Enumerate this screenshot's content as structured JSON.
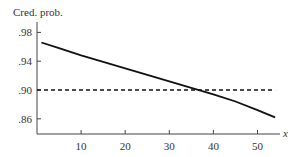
{
  "chart_data": {
    "type": "line",
    "title": "",
    "ylabel": "Cred. prob.",
    "xlabel": "x",
    "xlim": [
      0,
      55
    ],
    "ylim": [
      0.853,
      0.988
    ],
    "grid": false,
    "legend": null,
    "x_ticks": [
      10,
      20,
      30,
      40,
      50
    ],
    "x_tick_labels": [
      "10",
      "20",
      "30",
      "40",
      "50"
    ],
    "y_ticks": [
      0.98,
      0.94,
      0.9,
      0.86
    ],
    "y_tick_labels": [
      ".98",
      ".94",
      ".90",
      ".86"
    ],
    "series": [
      {
        "name": "Credible probability",
        "style": "solid",
        "x": [
          1,
          5,
          10,
          15,
          20,
          25,
          30,
          35,
          40,
          45,
          50,
          54
        ],
        "y": [
          0.966,
          0.958,
          0.948,
          0.939,
          0.93,
          0.921,
          0.912,
          0.903,
          0.894,
          0.884,
          0.872,
          0.862
        ]
      },
      {
        "name": "Reference level .90",
        "style": "dashed",
        "x": [
          0,
          54
        ],
        "y": [
          0.9,
          0.9
        ]
      }
    ]
  }
}
